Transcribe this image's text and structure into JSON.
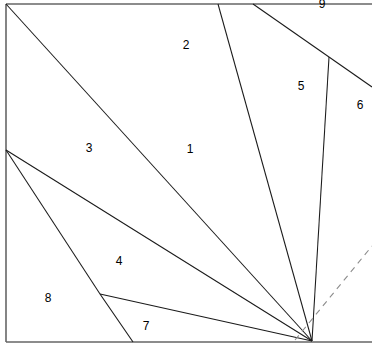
{
  "figure": {
    "type": "geometric-partition-diagram",
    "background_color": "#ffffff",
    "stroke_color": "#1a1a1a",
    "border_color": "#666666",
    "dashed_stroke_color": "#8c8c8c",
    "canvas": {
      "width": 372,
      "height": 352
    }
  },
  "border": {
    "name": "outer-square",
    "left_x": 6,
    "top_y": 4,
    "right_x": 372,
    "bottom_y": 342
  },
  "vertices": {
    "top_left": {
      "x": 6,
      "y": 4
    },
    "left_fan": {
      "x": 6,
      "y": 150
    },
    "bottom_left": {
      "x": 6,
      "y": 342
    },
    "bottom_apex": {
      "x": 312,
      "y": 341
    },
    "right_branch": {
      "x": 329,
      "y": 57
    },
    "lower_left_node": {
      "x": 100,
      "y": 294
    }
  },
  "segments": [
    {
      "name": "seg-top-left-to-apex",
      "x1": 6,
      "y1": 4,
      "x2": 312,
      "y2": 341,
      "style": "solid"
    },
    {
      "name": "seg-top-218-to-apex",
      "x1": 218,
      "y1": 4,
      "x2": 312,
      "y2": 341,
      "style": "solid"
    },
    {
      "name": "seg-top-253-to-right-branch",
      "x1": 253,
      "y1": 4,
      "x2": 329,
      "y2": 57,
      "style": "solid"
    },
    {
      "name": "seg-right-branch-to-right-edge",
      "x1": 329,
      "y1": 57,
      "x2": 372,
      "y2": 87,
      "style": "solid"
    },
    {
      "name": "seg-right-branch-to-apex",
      "x1": 329,
      "y1": 57,
      "x2": 312,
      "y2": 341,
      "style": "solid"
    },
    {
      "name": "seg-left-fan-to-apex",
      "x1": 6,
      "y1": 150,
      "x2": 312,
      "y2": 341,
      "style": "solid"
    },
    {
      "name": "seg-left-fan-to-node",
      "x1": 6,
      "y1": 150,
      "x2": 100,
      "y2": 294,
      "style": "solid"
    },
    {
      "name": "seg-node-to-bottom",
      "x1": 100,
      "y1": 294,
      "x2": 133,
      "y2": 342,
      "style": "solid"
    },
    {
      "name": "seg-node-to-apex",
      "x1": 100,
      "y1": 294,
      "x2": 312,
      "y2": 341,
      "style": "solid"
    },
    {
      "name": "seg-dashed-diagonal",
      "x1": 295,
      "y1": 340,
      "x2": 372,
      "y2": 246,
      "style": "dashed"
    }
  ],
  "labels": [
    {
      "name": "region-label-1",
      "text": "1",
      "x": 190,
      "y": 149
    },
    {
      "name": "region-label-2",
      "text": "2",
      "x": 186,
      "y": 45
    },
    {
      "name": "region-label-3",
      "text": "3",
      "x": 89,
      "y": 148
    },
    {
      "name": "region-label-4",
      "text": "4",
      "x": 119,
      "y": 261
    },
    {
      "name": "region-label-5",
      "text": "5",
      "x": 301,
      "y": 86
    },
    {
      "name": "region-label-6",
      "text": "6",
      "x": 360,
      "y": 105
    },
    {
      "name": "region-label-7",
      "text": "7",
      "x": 146,
      "y": 326
    },
    {
      "name": "region-label-8",
      "text": "8",
      "x": 48,
      "y": 298
    },
    {
      "name": "region-label-9",
      "text": "9",
      "x": 322,
      "y": 4
    }
  ]
}
